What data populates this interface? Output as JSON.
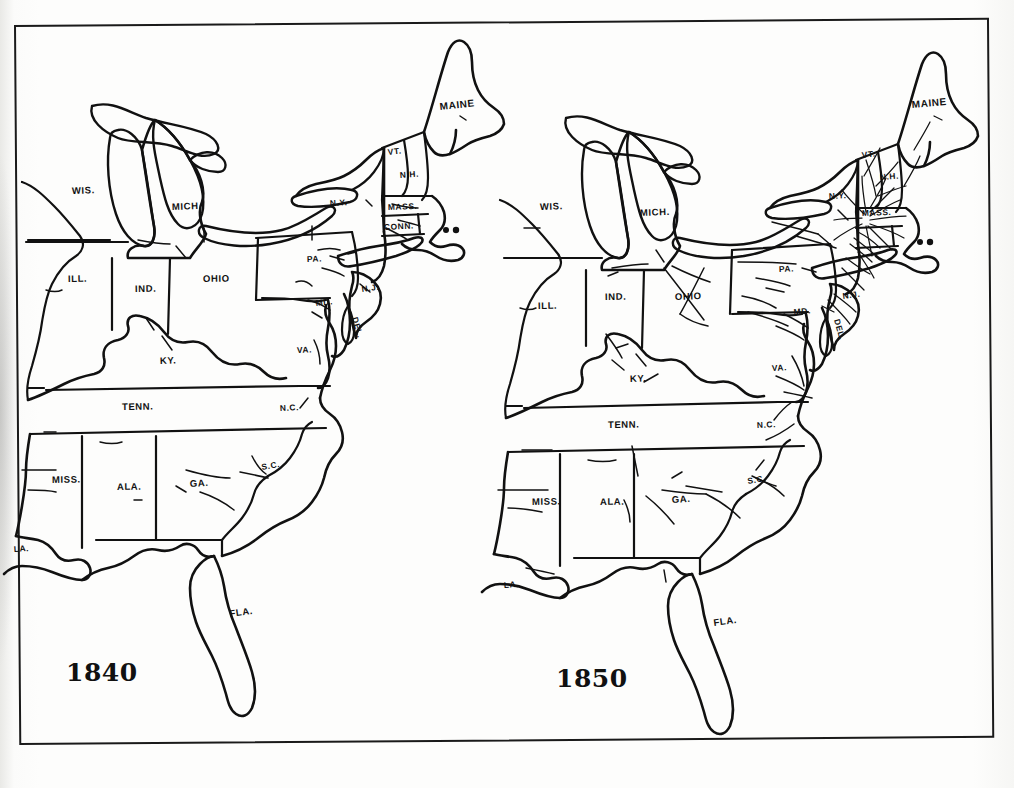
{
  "page": {
    "kind": "scanned-book-page",
    "content_type": "historical-map-pair",
    "frame": {
      "style": "thin black rectangular rule border"
    }
  },
  "maps": [
    {
      "id": "map-1840",
      "year_label": "1840",
      "caption_position": "bottom-left",
      "description": "Outline map of the eastern United States with sparse railroad lines",
      "rail_density": "sparse",
      "states": [
        {
          "abbr": "WIS.",
          "name": "Wisconsin",
          "x": 72,
          "y": 194
        },
        {
          "abbr": "MICH.",
          "name": "Michigan",
          "x": 172,
          "y": 210
        },
        {
          "abbr": "ILL.",
          "name": "Illinois",
          "x": 68,
          "y": 282
        },
        {
          "abbr": "IND.",
          "name": "Indiana",
          "x": 135,
          "y": 292
        },
        {
          "abbr": "OHIO",
          "name": "Ohio",
          "x": 203,
          "y": 282
        },
        {
          "abbr": "KY.",
          "name": "Kentucky",
          "x": 160,
          "y": 364
        },
        {
          "abbr": "TENN.",
          "name": "Tennessee",
          "x": 122,
          "y": 410
        },
        {
          "abbr": "MISS.",
          "name": "Mississippi",
          "x": 52,
          "y": 483
        },
        {
          "abbr": "ALA.",
          "name": "Alabama",
          "x": 117,
          "y": 490
        },
        {
          "abbr": "GA.",
          "name": "Georgia",
          "x": 190,
          "y": 487
        },
        {
          "abbr": "FLA.",
          "name": "Florida",
          "x": 230,
          "y": 617
        },
        {
          "abbr": "S.C.",
          "name": "South Carolina",
          "x": 262,
          "y": 470
        },
        {
          "abbr": "N.C.",
          "name": "North Carolina",
          "x": 280,
          "y": 411
        },
        {
          "abbr": "VA.",
          "name": "Virginia",
          "x": 297,
          "y": 353
        },
        {
          "abbr": "LA.",
          "name": "Louisiana",
          "x": 14,
          "y": 552
        },
        {
          "abbr": "PA.",
          "name": "Pennsylvania",
          "x": 307,
          "y": 262
        },
        {
          "abbr": "N.Y.",
          "name": "New York",
          "x": 340,
          "y": 206
        },
        {
          "abbr": "N.J.",
          "name": "New Jersey",
          "x": 368,
          "y": 292
        },
        {
          "abbr": "DEL.",
          "name": "Delaware",
          "x": 354,
          "y": 318,
          "rotated": true
        },
        {
          "abbr": "MD.",
          "name": "Maryland",
          "x": 325,
          "y": 304
        },
        {
          "abbr": "MASS.",
          "name": "Massachusetts",
          "x": 405,
          "y": 206
        },
        {
          "abbr": "CONN.",
          "name": "Connecticut",
          "x": 399,
          "y": 227
        },
        {
          "abbr": "VT.",
          "name": "Vermont",
          "x": 394,
          "y": 150
        },
        {
          "abbr": "N.H.",
          "name": "New Hampshire",
          "x": 411,
          "y": 173
        },
        {
          "abbr": "MAINE",
          "name": "Maine",
          "x": 455,
          "y": 107
        }
      ]
    },
    {
      "id": "map-1850",
      "year_label": "1850",
      "caption_position": "bottom-left",
      "description": "Outline map of the eastern United States with a much denser railroad network",
      "rail_density": "dense",
      "states": [
        {
          "abbr": "WIS.",
          "name": "Wisconsin",
          "x": 540,
          "y": 210
        },
        {
          "abbr": "MICH.",
          "name": "Michigan",
          "x": 640,
          "y": 216
        },
        {
          "abbr": "ILL.",
          "name": "Illinois",
          "x": 538,
          "y": 309
        },
        {
          "abbr": "IND.",
          "name": "Indiana",
          "x": 605,
          "y": 300
        },
        {
          "abbr": "OHIO",
          "name": "Ohio",
          "x": 675,
          "y": 300
        },
        {
          "abbr": "KY.",
          "name": "Kentucky",
          "x": 630,
          "y": 382
        },
        {
          "abbr": "TENN.",
          "name": "Tennessee",
          "x": 608,
          "y": 428
        },
        {
          "abbr": "MISS.",
          "name": "Mississippi",
          "x": 532,
          "y": 505
        },
        {
          "abbr": "ALA.",
          "name": "Alabama",
          "x": 600,
          "y": 505
        },
        {
          "abbr": "GA.",
          "name": "Georgia",
          "x": 672,
          "y": 503
        },
        {
          "abbr": "FLA.",
          "name": "Florida",
          "x": 722,
          "y": 626
        },
        {
          "abbr": "S.C.",
          "name": "South Carolina",
          "x": 748,
          "y": 484
        },
        {
          "abbr": "N.C.",
          "name": "North Carolina",
          "x": 757,
          "y": 428
        },
        {
          "abbr": "VA.",
          "name": "Virginia",
          "x": 772,
          "y": 371
        },
        {
          "abbr": "LA.",
          "name": "Louisiana",
          "x": 504,
          "y": 588
        },
        {
          "abbr": "PA.",
          "name": "Pennsylvania",
          "x": 779,
          "y": 272
        },
        {
          "abbr": "N.Y.",
          "name": "New York",
          "x": 829,
          "y": 199
        },
        {
          "abbr": "N.J.",
          "name": "New Jersey",
          "x": 843,
          "y": 299
        },
        {
          "abbr": "DEL.",
          "name": "Delaware",
          "x": 834,
          "y": 320,
          "rotated": true
        },
        {
          "abbr": "MD.",
          "name": "Maryland",
          "x": 801,
          "y": 313
        },
        {
          "abbr": "MASS.",
          "name": "Massachusetts",
          "x": 879,
          "y": 212
        },
        {
          "abbr": "N.H.",
          "name": "New Hampshire",
          "x": 890,
          "y": 177
        },
        {
          "abbr": "VT.",
          "name": "Vermont",
          "x": 866,
          "y": 155
        },
        {
          "abbr": "MAINE",
          "name": "Maine",
          "x": 927,
          "y": 105
        }
      ]
    }
  ],
  "colors": {
    "ink": "#111111",
    "paper": "#fdfdfc",
    "frame": "#1a1a1a"
  }
}
